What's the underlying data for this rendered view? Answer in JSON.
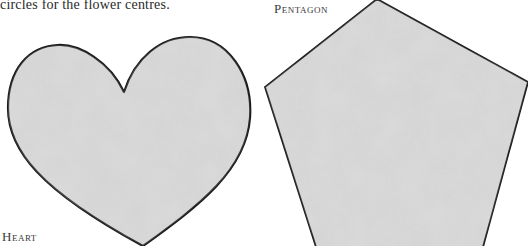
{
  "page": {
    "intro_text": "circles for the flower centres.",
    "templates": [
      {
        "id": "heart",
        "label": "Heart"
      },
      {
        "id": "pentagon",
        "label": "Pentagon"
      }
    ]
  },
  "colors": {
    "fill": "#d4d4d4",
    "outline": "#1a1a1a",
    "background": "#ffffff"
  }
}
